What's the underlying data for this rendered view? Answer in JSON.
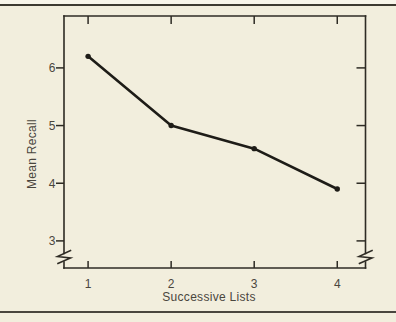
{
  "figure": {
    "background_color": "#f2eedd",
    "top_rule_color": "#3d3a31",
    "bottom_rule_color": "#4a463e"
  },
  "chart_data": {
    "type": "line",
    "title": "",
    "x": [
      1,
      2,
      3,
      4
    ],
    "values": [
      6.2,
      5.0,
      4.6,
      3.9
    ],
    "x_tick_labels": [
      "1",
      "2",
      "3",
      "4"
    ],
    "y_tick_values": [
      6,
      5,
      4,
      3
    ],
    "y_tick_labels": [
      "6",
      "5",
      "4",
      "3"
    ],
    "xlabel": "Successive Lists",
    "ylabel": "Mean Recall",
    "xlim": [
      0.71,
      4.34
    ],
    "ylim": [
      2.53,
      6.9
    ],
    "y_axis_break": true,
    "grid": false,
    "legend": "none",
    "marker": "filled-circle",
    "line_color": "#1e1c17",
    "axis_color": "#2e2b24",
    "text_color": "#4a463d"
  }
}
